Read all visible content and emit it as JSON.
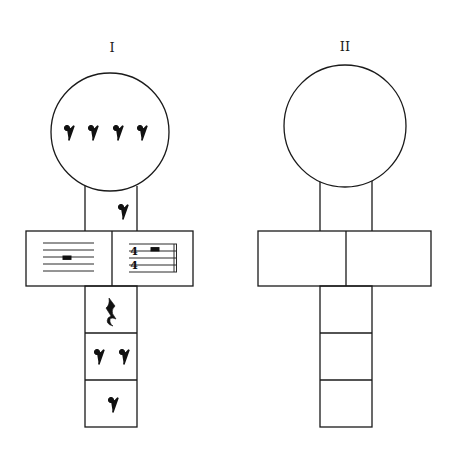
{
  "figures": [
    {
      "label": "I",
      "circle": {
        "content": "eighth-rest",
        "count": 4
      },
      "upper_stem": {
        "content": "eighth-rest",
        "count": 1
      },
      "bar_left": {
        "content": "five-line staff with whole rest"
      },
      "bar_right": {
        "content": "staff with 4/4 time signature, half rest, final double barline",
        "time_signature": {
          "top": "4",
          "bottom": "4"
        }
      },
      "lower_cells": [
        {
          "content": "quarter-rest",
          "count": 1
        },
        {
          "content": "eighth-rest",
          "count": 2
        },
        {
          "content": "eighth-rest",
          "count": 1
        }
      ]
    },
    {
      "label": "II",
      "circle": {
        "content": "empty",
        "count": 0
      },
      "upper_stem": {
        "content": "empty",
        "count": 0
      },
      "bar_left": {
        "content": "empty"
      },
      "bar_right": {
        "content": "empty"
      },
      "lower_cells": [
        {
          "content": "empty",
          "count": 0
        },
        {
          "content": "empty",
          "count": 0
        },
        {
          "content": "empty",
          "count": 0
        }
      ]
    }
  ],
  "colors": {
    "ink": "#1a1a1a",
    "paper": "#ffffff"
  }
}
